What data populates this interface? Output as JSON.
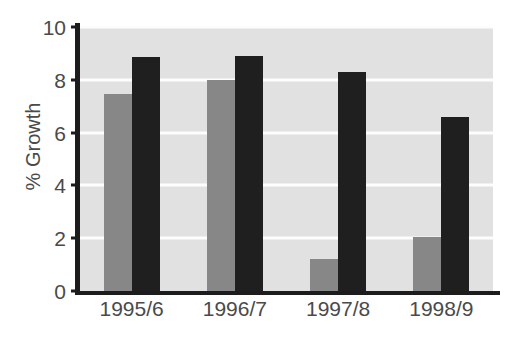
{
  "chart_data": {
    "type": "bar",
    "title": "",
    "xlabel": "",
    "ylabel": "% Growth",
    "categories": [
      "1995/6",
      "1996/7",
      "1997/8",
      "1998/9"
    ],
    "series": [
      {
        "name": "series-gray",
        "color": "#878787",
        "values": [
          7.45,
          8.0,
          1.2,
          2.05
        ]
      },
      {
        "name": "series-black",
        "color": "#1f1f1f",
        "values": [
          8.85,
          8.9,
          8.3,
          6.6
        ]
      }
    ],
    "ylim": [
      0,
      10
    ],
    "yticks": [
      0,
      2,
      4,
      6,
      8,
      10
    ],
    "ytick_labels": [
      "0",
      "2",
      "4",
      "6",
      "8",
      "10"
    ],
    "grid": true,
    "gridline_color": "#fdfdfd",
    "plot_background": "#e1e1e1",
    "axis_color": "#1c1c1c",
    "legend": "none"
  }
}
